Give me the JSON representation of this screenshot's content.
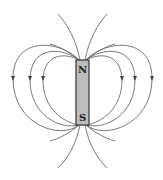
{
  "diagram": {
    "magnet": {
      "north_label": "N",
      "south_label": "S",
      "fill_color": "#bdbdbd",
      "outline_color": "#333333"
    },
    "field_line_color": "#6b6b6b",
    "arrow_direction": "down",
    "closed_loops_per_side": 3,
    "open_lines_top": 2,
    "open_lines_bottom": 2
  }
}
